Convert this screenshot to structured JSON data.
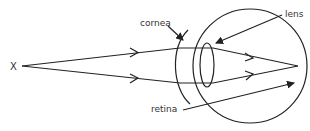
{
  "diagram": {
    "labels": {
      "object": "X",
      "cornea": "cornea",
      "lens": "lens",
      "retina": "retina"
    },
    "colors": {
      "stroke": "#222222",
      "text": "#333333",
      "background": "#ffffff"
    }
  }
}
